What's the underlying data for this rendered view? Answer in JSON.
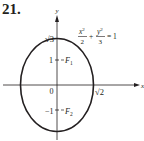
{
  "problem": {
    "number": "21."
  },
  "axes": {
    "x_label": "x",
    "y_label": "y",
    "origin_label": "0"
  },
  "equation": {
    "term1_num": "x",
    "term1_exp": "2",
    "term1_den": "2",
    "plus": "+",
    "term2_num": "y",
    "term2_exp": "2",
    "term2_den": "3",
    "equals": "= 1"
  },
  "ellipse": {
    "semi_major_label": "√3",
    "semi_minor_label": "√2",
    "focus1": {
      "tick": "1",
      "label": "F",
      "sub": "1"
    },
    "focus2": {
      "tick": "−1",
      "label": "F",
      "sub": "2"
    }
  },
  "colors": {
    "ink": "#231f20",
    "background": "#ffffff"
  }
}
